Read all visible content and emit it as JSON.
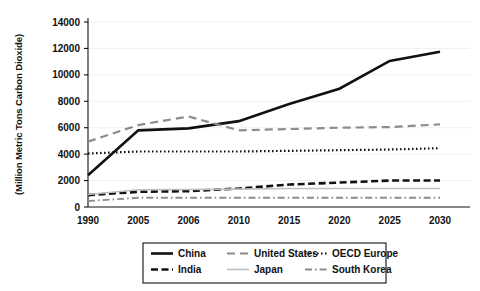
{
  "chart_data": {
    "type": "line",
    "title": "",
    "xlabel": "",
    "ylabel": "(Million Metric Tons Carbon Dioxide)",
    "categories": [
      "1990",
      "2005",
      "2006",
      "2010",
      "2015",
      "2020",
      "2025",
      "2030"
    ],
    "ylim": [
      0,
      14000
    ],
    "yticks": [
      0,
      2000,
      4000,
      6000,
      8000,
      10000,
      12000,
      14000
    ],
    "ytick_labels": [
      "0",
      "2000",
      "4000",
      "6000",
      "8000",
      "10000",
      "12000",
      "14000"
    ],
    "grid": true,
    "legend_position": "bottom",
    "series": [
      {
        "name": "China",
        "color": "#111111",
        "style": "solid",
        "values": [
          2400,
          5800,
          5950,
          6500,
          7800,
          8950,
          11050,
          11750
        ]
      },
      {
        "name": "United States",
        "color": "#8c8c8c",
        "style": "dashed",
        "values": [
          4950,
          6200,
          6850,
          5800,
          5900,
          6000,
          6050,
          6250
        ]
      },
      {
        "name": "OECD Europe",
        "color": "#111111",
        "style": "dotted",
        "values": [
          4050,
          4200,
          4200,
          4200,
          4250,
          4300,
          4350,
          4450
        ]
      },
      {
        "name": "India",
        "color": "#111111",
        "style": "dashed-heavy",
        "values": [
          900,
          1150,
          1200,
          1400,
          1700,
          1850,
          2000,
          2000
        ]
      },
      {
        "name": "Japan",
        "color": "#bfbfbf",
        "style": "solid-light",
        "values": [
          950,
          1300,
          1320,
          1350,
          1400,
          1400,
          1400,
          1400
        ]
      },
      {
        "name": "South Korea",
        "color": "#8c8c8c",
        "style": "dash-dot",
        "values": [
          450,
          700,
          700,
          700,
          700,
          700,
          700,
          700
        ]
      }
    ],
    "legend_entries": [
      {
        "label": "China",
        "style": "solid",
        "color": "#111111"
      },
      {
        "label": "United States",
        "style": "dashed",
        "color": "#8c8c8c"
      },
      {
        "label": "OECD Europe",
        "style": "dotted",
        "color": "#111111"
      },
      {
        "label": "India",
        "style": "dashed-heavy",
        "color": "#111111"
      },
      {
        "label": "Japan",
        "style": "solid-light",
        "color": "#bfbfbf"
      },
      {
        "label": "South Korea",
        "style": "dash-dot",
        "color": "#8c8c8c"
      }
    ]
  }
}
